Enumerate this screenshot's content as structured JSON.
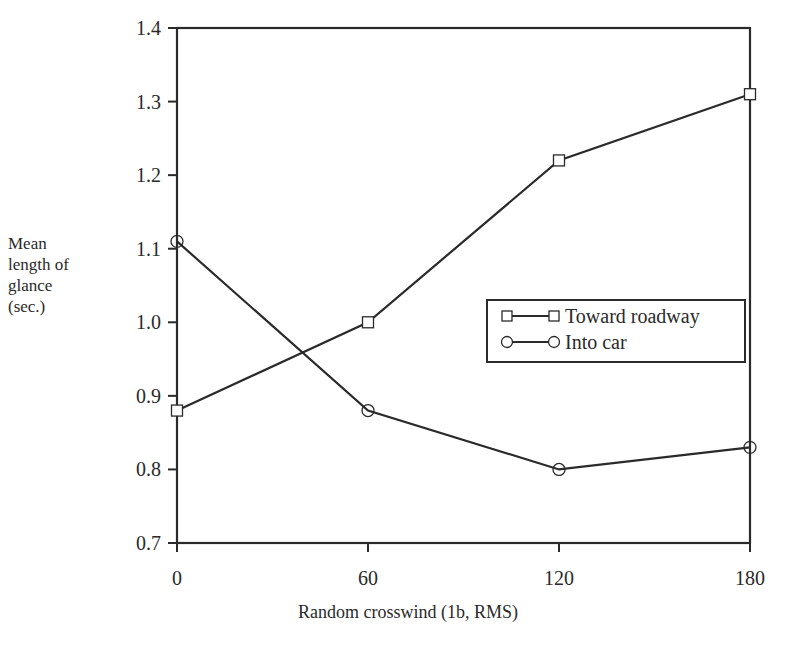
{
  "chart_data": {
    "type": "line",
    "title": "",
    "xlabel": "Random crosswind (1b, RMS)",
    "ylabel": "Mean length of glance (sec.)",
    "ylabel_lines": [
      "Mean",
      "length of",
      "glance",
      "(sec.)"
    ],
    "x": [
      0,
      60,
      120,
      180
    ],
    "xticks": [
      "0",
      "60",
      "120",
      "180"
    ],
    "yticks": [
      "0.7",
      "0.8",
      "0.9",
      "1.0",
      "1.1",
      "1.2",
      "1.3",
      "1.4"
    ],
    "xlim": [
      0,
      180
    ],
    "ylim": [
      0.7,
      1.4
    ],
    "grid": false,
    "legend_position": "center-right",
    "series": [
      {
        "name": "Toward roadway",
        "marker": "square",
        "values": [
          0.88,
          1.0,
          1.22,
          1.31
        ]
      },
      {
        "name": "Into car",
        "marker": "circle",
        "values": [
          1.11,
          0.88,
          0.8,
          0.83
        ]
      }
    ]
  },
  "colors": {
    "ink": "#2a2a2a",
    "background": "#ffffff"
  }
}
